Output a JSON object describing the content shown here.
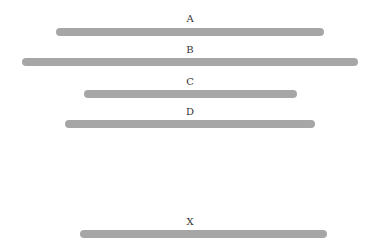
{
  "diagram": {
    "bar_color": "#a6a6a6",
    "lines": [
      {
        "label": "A",
        "x1": 56,
        "x2": 324,
        "y": 32,
        "label_y": 14
      },
      {
        "label": "B",
        "x1": 22,
        "x2": 358,
        "y": 62,
        "label_y": 45
      },
      {
        "label": "C",
        "x1": 84,
        "x2": 297,
        "y": 94,
        "label_y": 77
      },
      {
        "label": "D",
        "x1": 65,
        "x2": 315,
        "y": 124,
        "label_y": 107
      },
      {
        "label": "X",
        "x1": 80,
        "x2": 327,
        "y": 234,
        "label_y": 217
      }
    ]
  }
}
